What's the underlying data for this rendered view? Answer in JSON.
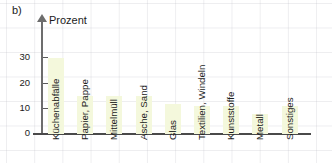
{
  "panel": {
    "label": "b)"
  },
  "chart_data": {
    "type": "bar",
    "title": "",
    "subtitle": "",
    "ylabel": "Prozent",
    "xlabel": "",
    "ylim": [
      0,
      33
    ],
    "yticks": [
      0,
      10,
      20,
      30
    ],
    "ytick_labels": [
      "0",
      "10",
      "20",
      "30"
    ],
    "grid": true,
    "legend": "none",
    "bar_color": "#f4f8dc",
    "categories": [
      "Küchenabfälle",
      "Papier, Pappe",
      "Mittelmüll",
      "Asche, Sand",
      "Glas",
      "Textilien, Windeln",
      "Kunststoffe",
      "Metall",
      "Sonstiges"
    ],
    "values": [
      30,
      15,
      15,
      15,
      12,
      11,
      11,
      8,
      11
    ]
  }
}
